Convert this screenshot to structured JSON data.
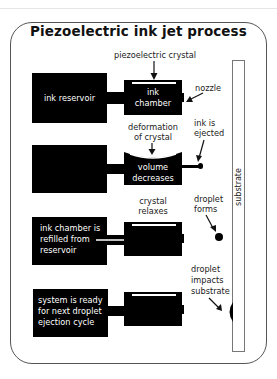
{
  "title": "Piezoelectric ink jet process",
  "stages": [
    {
      "reservoir_text": "ink reservoir",
      "chamber_text": [
        "ink",
        "chamber"
      ],
      "annotations": {
        "top": "piezoelectric crystal",
        "right": "nozzle"
      }
    },
    {
      "reservoir_text": "",
      "chamber_text": [
        "volume",
        "decreases"
      ],
      "annotations": {
        "top": [
          "deformation",
          "of crystal"
        ],
        "right": [
          "ink is",
          "ejected"
        ]
      }
    },
    {
      "reservoir_text": [
        "ink chamber is",
        "refilled from",
        "reservoir"
      ],
      "chamber_text": "",
      "annotations": {
        "top": [
          "crystal",
          "relaxes"
        ],
        "right": [
          "droplet",
          "forms"
        ]
      }
    },
    {
      "reservoir_text": [
        "system is ready",
        "for next droplet",
        "ejection cycle"
      ],
      "chamber_text": "",
      "annotations": {
        "right": [
          "droplet",
          "impacts",
          "substrate"
        ]
      }
    }
  ],
  "substrate_label": "substrate",
  "colors": {
    "box": "#000000",
    "background": "#ffffff",
    "border": "#555555"
  }
}
